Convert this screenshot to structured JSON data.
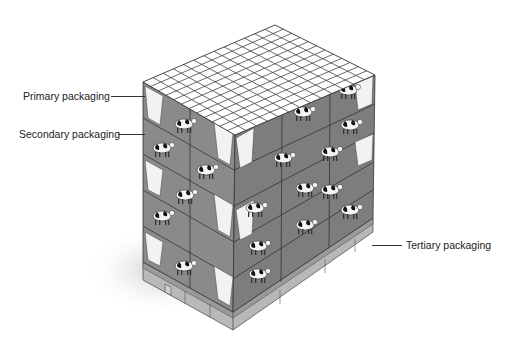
{
  "diagram": {
    "labels": {
      "primary": "Primary packaging",
      "secondary": "Secondary packaging",
      "tertiary": "Tertiary packaging"
    },
    "colors": {
      "box_left": "#8a8a8a",
      "box_right": "#7d7d7d",
      "top_grid_fill": "#ffffff",
      "grid_line": "#444444",
      "carton": "#f2f2f2",
      "pallet": "#b5b5b5",
      "shadow": "#d8d8d8"
    },
    "top_grid": {
      "rows": 12,
      "cols": 13
    },
    "layers": 5
  }
}
